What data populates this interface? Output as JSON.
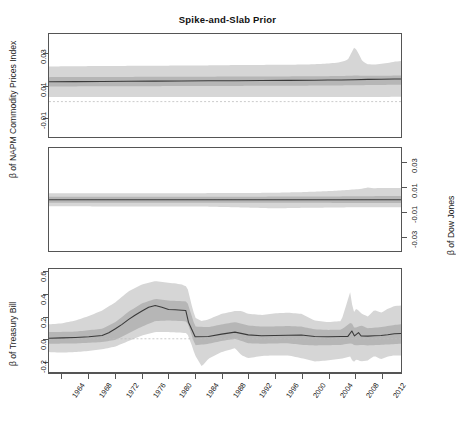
{
  "chart_data": {
    "type": "line",
    "title": "Spike-and-Slab Prior",
    "xlabel": "",
    "grid": false,
    "legend": "none",
    "x_tick_labels": [
      "1964",
      "1968",
      "1972",
      "1976",
      "1980",
      "1984",
      "1988",
      "1992",
      "1996",
      "2000",
      "2004",
      "2008",
      "2012"
    ],
    "x_range": [
      1962,
      2015
    ],
    "panels": [
      {
        "id": "napm",
        "ylabel": "β of NAPM Commodity Prices Index",
        "ylabel_side": "left",
        "y_tick_labels": [
          "0.03",
          "0.01",
          "-0.01"
        ],
        "y_ticks": [
          0.03,
          0.01,
          -0.01
        ],
        "ylim": [
          -0.022,
          0.042
        ],
        "zero_reference_line": 0.0,
        "series": [
          {
            "name": "posterior median",
            "x": [
              1962,
              1966,
              1970,
              1974,
              1978,
              1982,
              1986,
              1990,
              1994,
              1998,
              2002,
              2004,
              2006,
              2008,
              2010,
              2012,
              2014,
              2015
            ],
            "values": [
              0.0123,
              0.0124,
              0.0125,
              0.0126,
              0.0127,
              0.0128,
              0.0129,
              0.013,
              0.0131,
              0.0132,
              0.0133,
              0.0134,
              0.0134,
              0.0136,
              0.0138,
              0.0139,
              0.014,
              0.014
            ]
          }
        ],
        "bands": [
          {
            "name": "inner credible band",
            "x": [
              1962,
              1970,
              1978,
              1986,
              1994,
              2000,
              2004,
              2007,
              2008,
              2009,
              2011,
              2013,
              2015
            ],
            "upper": [
              0.0152,
              0.0153,
              0.0154,
              0.0155,
              0.0156,
              0.0157,
              0.0158,
              0.016,
              0.0162,
              0.0161,
              0.016,
              0.0161,
              0.0162
            ],
            "lower": [
              0.0094,
              0.0095,
              0.0096,
              0.0097,
              0.0098,
              0.0099,
              0.01,
              0.0101,
              0.0102,
              0.0102,
              0.0103,
              0.0104,
              0.0104
            ]
          },
          {
            "name": "outer credible band",
            "x": [
              1962,
              1966,
              1970,
              1974,
              1978,
              1982,
              1986,
              1990,
              1994,
              1998,
              2001,
              2003,
              2005,
              2006,
              2007,
              2008,
              2008.6,
              2009.2,
              2010,
              2011,
              2012,
              2013,
              2014,
              2015
            ],
            "upper": [
              0.0218,
              0.022,
              0.0221,
              0.0222,
              0.0223,
              0.0224,
              0.0225,
              0.0227,
              0.0228,
              0.0229,
              0.0231,
              0.0234,
              0.024,
              0.0246,
              0.026,
              0.034,
              0.03,
              0.025,
              0.0232,
              0.023,
              0.0235,
              0.024,
              0.0248,
              0.0252
            ],
            "lower": [
              0.0028,
              0.0028,
              0.0028,
              0.0028,
              0.0028,
              0.0028,
              0.0029,
              0.0029,
              0.0029,
              0.0029,
              0.0029,
              0.0029,
              0.0029,
              0.0029,
              0.0029,
              0.0029,
              0.0029,
              0.0029,
              0.0029,
              0.0029,
              0.0029,
              0.0029,
              0.003,
              0.003
            ]
          }
        ]
      },
      {
        "id": "dow",
        "ylabel": "β of Dow Jones",
        "ylabel_side": "right",
        "y_tick_labels": [
          "0.03",
          "0.01",
          "-0.01",
          "-0.03"
        ],
        "y_ticks": [
          0.03,
          0.01,
          -0.01,
          -0.03
        ],
        "ylim": [
          -0.042,
          0.042
        ],
        "zero_reference_line": 0.0,
        "series": [
          {
            "name": "posterior median",
            "x": [
              1962,
              1970,
              1980,
              1990,
              2000,
              2008,
              2015
            ],
            "values": [
              -0.0002,
              -0.0002,
              -0.0002,
              -0.0002,
              -0.0002,
              -0.0002,
              -0.0002
            ]
          }
        ],
        "bands": [
          {
            "name": "inner credible band",
            "x": [
              1962,
              1975,
              1990,
              2000,
              2008,
              2012,
              2015
            ],
            "upper": [
              0.0022,
              0.0022,
              0.0023,
              0.0024,
              0.0026,
              0.0028,
              0.0028
            ],
            "lower": [
              -0.0026,
              -0.0026,
              -0.0027,
              -0.0027,
              -0.0028,
              -0.0029,
              -0.0029
            ]
          },
          {
            "name": "outer credible band",
            "x": [
              1962,
              1968,
              1974,
              1980,
              1986,
              1992,
              1996,
              2000,
              2004,
              2007,
              2009,
              2010,
              2011,
              2012,
              2013,
              2015
            ],
            "upper": [
              0.005,
              0.005,
              0.0051,
              0.0051,
              0.0052,
              0.0053,
              0.0055,
              0.006,
              0.0068,
              0.0078,
              0.0086,
              0.0098,
              0.0092,
              0.0094,
              0.0093,
              0.0093
            ],
            "lower": [
              -0.0056,
              -0.0056,
              -0.0057,
              -0.0057,
              -0.0058,
              -0.0066,
              -0.0072,
              -0.0068,
              -0.0066,
              -0.0064,
              -0.0064,
              -0.0064,
              -0.0064,
              -0.0064,
              -0.0064,
              -0.0064
            ]
          }
        ]
      },
      {
        "id": "tbill",
        "ylabel": "β of Treasury Bill",
        "ylabel_side": "left",
        "y_tick_labels": [
          "0.6",
          "0.4",
          "0.2",
          "0.0",
          "-0.2"
        ],
        "y_ticks": [
          0.6,
          0.4,
          0.2,
          0.0,
          -0.2
        ],
        "ylim": [
          -0.3,
          0.63
        ],
        "zero_reference_line": 0.0,
        "series": [
          {
            "name": "posterior median",
            "x": [
              1962,
              1964,
              1966,
              1968,
              1970,
              1971,
              1972,
              1973,
              1974,
              1975,
              1976,
              1977,
              1978,
              1979,
              1980,
              1981,
              1982,
              1982.6,
              1983,
              1984,
              1986,
              1988,
              1990,
              1992,
              1994,
              1996,
              1998,
              2000,
              2002,
              2004,
              2006,
              2007,
              2007.6,
              2008,
              2008.6,
              2009,
              2010,
              2011,
              2012,
              2013,
              2014,
              2015
            ],
            "values": [
              0.005,
              0.008,
              0.012,
              0.018,
              0.03,
              0.055,
              0.09,
              0.13,
              0.175,
              0.215,
              0.25,
              0.285,
              0.3,
              0.285,
              0.265,
              0.262,
              0.258,
              0.255,
              0.15,
              0.018,
              0.02,
              0.042,
              0.06,
              0.035,
              0.028,
              0.03,
              0.032,
              0.034,
              0.02,
              0.018,
              0.02,
              0.022,
              0.07,
              0.026,
              0.055,
              0.025,
              0.024,
              0.028,
              0.03,
              0.036,
              0.045,
              0.048
            ]
          }
        ],
        "bands": [
          {
            "name": "inner credible band",
            "x": [
              1962,
              1966,
              1970,
              1972,
              1974,
              1976,
              1978,
              1980,
              1982,
              1982.8,
              1984,
              1986,
              1988,
              1990,
              1992,
              1994,
              1996,
              1998,
              2000,
              2002,
              2004,
              2006,
              2007.5,
              2008,
              2009,
              2010,
              2012,
              2014,
              2015
            ],
            "upper": [
              0.06,
              0.065,
              0.09,
              0.15,
              0.245,
              0.32,
              0.36,
              0.345,
              0.34,
              0.335,
              0.11,
              0.105,
              0.13,
              0.15,
              0.12,
              0.11,
              0.112,
              0.115,
              0.11,
              0.085,
              0.08,
              0.082,
              0.15,
              0.095,
              0.12,
              0.095,
              0.105,
              0.125,
              0.13
            ],
            "lower": [
              -0.045,
              -0.042,
              -0.03,
              -0.01,
              0.05,
              0.11,
              0.16,
              0.165,
              0.16,
              0.155,
              -0.06,
              -0.045,
              -0.02,
              0.0,
              -0.04,
              -0.045,
              -0.042,
              -0.04,
              -0.055,
              -0.06,
              -0.058,
              -0.055,
              -0.04,
              -0.06,
              -0.055,
              -0.06,
              -0.055,
              -0.048,
              -0.045
            ]
          },
          {
            "name": "outer credible band",
            "x": [
              1962,
              1964,
              1966,
              1968,
              1970,
              1972,
              1974,
              1976,
              1978,
              1980,
              1981,
              1982,
              1982.8,
              1983.5,
              1984,
              1985,
              1986,
              1988,
              1990,
              1991,
              1992,
              1994,
              1996,
              1998,
              2000,
              2002,
              2004,
              2006,
              2007.4,
              2007.8,
              2008.3,
              2009,
              2010,
              2011,
              2012,
              2013,
              2014,
              2015
            ],
            "upper": [
              0.13,
              0.14,
              0.165,
              0.205,
              0.255,
              0.33,
              0.43,
              0.49,
              0.52,
              0.505,
              0.5,
              0.49,
              0.47,
              0.3,
              0.19,
              0.16,
              0.175,
              0.225,
              0.25,
              0.25,
              0.225,
              0.215,
              0.23,
              0.235,
              0.225,
              0.165,
              0.15,
              0.16,
              0.43,
              0.23,
              0.275,
              0.23,
              0.2,
              0.26,
              0.235,
              0.27,
              0.295,
              0.3
            ],
            "lower": [
              -0.12,
              -0.125,
              -0.12,
              -0.11,
              -0.095,
              -0.07,
              -0.02,
              0.03,
              0.06,
              0.06,
              0.058,
              0.055,
              0.05,
              -0.06,
              -0.15,
              -0.25,
              -0.18,
              -0.12,
              -0.085,
              -0.15,
              -0.175,
              -0.155,
              -0.15,
              -0.15,
              -0.175,
              -0.205,
              -0.195,
              -0.18,
              -0.16,
              -0.215,
              -0.185,
              -0.205,
              -0.195,
              -0.155,
              -0.185,
              -0.16,
              -0.15,
              -0.15
            ]
          }
        ]
      }
    ],
    "colors": {
      "outer_band": "#d6d6d6",
      "inner_band": "#b6b6b6",
      "median_line": "#3a3a3a",
      "zero_line": "#bdbdbd",
      "frame": "#555555",
      "text": "#222222"
    }
  }
}
